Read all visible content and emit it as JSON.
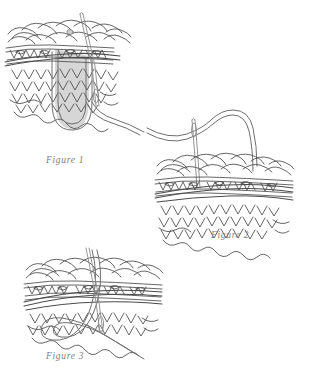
{
  "page": {
    "background_color": "#ffffff",
    "width": 317,
    "height": 368
  },
  "style": {
    "ink_color": "#3b3b3b",
    "fabric_line_color": "#4a4a4a",
    "yarn_outline_color": "#6e6e6e",
    "yarn_fill_color": "#d6d6d6",
    "needle_color": "#8a8a8a",
    "caption_color": "#807e7c"
  },
  "figures": [
    {
      "id": "figure-1",
      "caption": "Figure 1",
      "subject": "knitted-fabric-swatch",
      "elements": [
        "knitted fabric swatch",
        "tapestry needle inserted downward through fabric",
        "yarn strand forming a long U loop below the fabric",
        "yarn tail exiting to the lower right"
      ]
    },
    {
      "id": "figure-2",
      "caption": "Figure 2",
      "subject": "knitted-fabric-swatch",
      "elements": [
        "knitted fabric swatch",
        "tapestry needle standing upright at the left",
        "yarn strand arching over the top of the fabric",
        "yarn tail exiting to the left"
      ]
    },
    {
      "id": "figure-3",
      "caption": "Figure 3",
      "subject": "knitted-fabric-swatch",
      "elements": [
        "knitted fabric swatch",
        "tapestry needle angled through the fabric from upper left",
        "yarn strand looping below the fabric",
        "yarn tail exiting to the lower right"
      ]
    }
  ]
}
